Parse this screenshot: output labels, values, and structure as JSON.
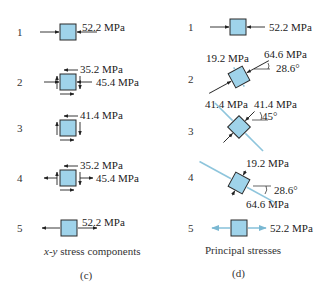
{
  "colors": {
    "element_fill": "#9fd3ea",
    "element_stroke": "#2a2a2a",
    "principal_tension_line": "#8ec5dc",
    "arrow": "#222222"
  },
  "panel_c": {
    "caption_prefix": "x-y",
    "caption_suffix": " stress components",
    "label": "(c)",
    "rows": [
      {
        "index": "1",
        "labels": [
          "52.2 MPa"
        ]
      },
      {
        "index": "2",
        "labels": [
          "35.2 MPa",
          "45.4 MPa"
        ]
      },
      {
        "index": "3",
        "labels": [
          "41.4 MPa"
        ]
      },
      {
        "index": "4",
        "labels": [
          "35.2 MPa",
          "45.4 MPa"
        ]
      },
      {
        "index": "5",
        "labels": [
          "52.2 MPa"
        ]
      }
    ]
  },
  "panel_d": {
    "caption": "Principal stresses",
    "label": "(d)",
    "rows": [
      {
        "index": "1",
        "labels": [
          "52.2 MPa"
        ]
      },
      {
        "index": "2",
        "labels": [
          "19.2 MPa",
          "64.6 MPa",
          "28.6°"
        ]
      },
      {
        "index": "3",
        "labels": [
          "41.4 MPa",
          "41.4 MPa",
          "45°"
        ]
      },
      {
        "index": "4",
        "labels": [
          "19.2 MPa",
          "28.6°",
          "64.6 MPa"
        ]
      },
      {
        "index": "5",
        "labels": [
          "52.2 MPa"
        ]
      }
    ]
  }
}
